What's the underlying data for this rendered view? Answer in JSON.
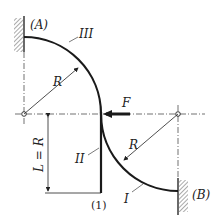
{
  "labels": {
    "support_a": "(A)",
    "support_b": "(B)",
    "segment_1": "I",
    "segment_2": "II",
    "segment_3": "III",
    "radius_top": "R",
    "radius_bottom": "R",
    "force": "F",
    "length": "L = R",
    "point_1": "(1)"
  },
  "colors": {
    "stroke": "#1a1a1a",
    "hatch": "#555555"
  }
}
